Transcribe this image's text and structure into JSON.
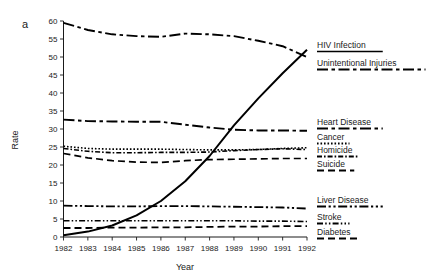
{
  "panel": {
    "label": "a"
  },
  "chart_data": {
    "type": "line",
    "title": "",
    "xlabel": "Year",
    "ylabel": "Rate",
    "xlim": [
      1982,
      1992
    ],
    "ylim": [
      0,
      60
    ],
    "ytick_step": 5,
    "grid": false,
    "legend_position": "right",
    "x": [
      1982,
      1983,
      1984,
      1985,
      1986,
      1987,
      1988,
      1989,
      1990,
      1991,
      1992
    ],
    "xticklabels": [
      "1982",
      "1983",
      "1984",
      "1985",
      "1986",
      "1987",
      "1988",
      "1989",
      "1990",
      "1991",
      "1992"
    ],
    "yticklabels": [
      "0",
      "5",
      "10",
      "15",
      "20",
      "25",
      "30",
      "35",
      "40",
      "45",
      "50",
      "55",
      "60"
    ],
    "series": [
      {
        "name": "HIV Infection",
        "dash": "solid",
        "width": 2.0,
        "values": [
          0.5,
          1.5,
          3.2,
          6.0,
          10.0,
          15.5,
          22.5,
          31.0,
          38.5,
          45.5,
          52.0
        ]
      },
      {
        "name": "Unintentional Injuries",
        "dash": "dashdot",
        "width": 1.9,
        "values": [
          59.5,
          57.5,
          56.3,
          55.8,
          55.6,
          56.5,
          56.3,
          55.8,
          54.5,
          53.0,
          50.0
        ]
      },
      {
        "name": "Heart Disease",
        "dash": "dashdot",
        "width": 1.9,
        "values": [
          32.6,
          32.2,
          32.1,
          32.0,
          32.0,
          31.2,
          30.4,
          29.8,
          29.6,
          29.6,
          29.5
        ]
      },
      {
        "name": "Cancer",
        "dash": "dotted",
        "width": 1.6,
        "values": [
          25.2,
          24.6,
          24.4,
          24.4,
          24.4,
          24.3,
          24.2,
          24.2,
          24.3,
          24.6,
          24.8
        ]
      },
      {
        "name": "Homicide",
        "dash": "dashdot-fine",
        "width": 1.6,
        "values": [
          24.6,
          23.8,
          23.4,
          23.4,
          23.5,
          23.5,
          23.6,
          24.0,
          24.3,
          24.5,
          24.3
        ]
      },
      {
        "name": "Suicide",
        "dash": "dashed",
        "width": 1.7,
        "values": [
          23.2,
          22.0,
          21.2,
          20.8,
          20.7,
          21.2,
          21.5,
          21.6,
          21.7,
          21.8,
          21.8
        ]
      },
      {
        "name": "Liver Disease",
        "dash": "dashdotdot",
        "width": 1.8,
        "values": [
          8.7,
          8.6,
          8.5,
          8.5,
          8.6,
          8.6,
          8.5,
          8.4,
          8.3,
          8.2,
          7.9
        ]
      },
      {
        "name": "Stroke",
        "dash": "dotted-dash",
        "width": 1.6,
        "values": [
          4.5,
          4.5,
          4.5,
          4.5,
          4.5,
          4.5,
          4.5,
          4.5,
          4.4,
          4.4,
          4.3
        ]
      },
      {
        "name": "Diabetes",
        "dash": "dashed",
        "width": 1.8,
        "values": [
          2.5,
          2.5,
          2.6,
          2.6,
          2.7,
          2.7,
          2.8,
          2.9,
          2.9,
          3.0,
          3.0
        ]
      }
    ]
  },
  "legend": {
    "entries": [
      {
        "label": "HIV Infection",
        "dash": "solid"
      },
      {
        "label": "Unintentional Injuries",
        "dash": "dashdot"
      },
      {
        "label": "Heart Disease",
        "dash": "dashdot"
      },
      {
        "label": "Cancer",
        "dash": "dotted"
      },
      {
        "label": "Homicide",
        "dash": "dashdot-fine"
      },
      {
        "label": "Suicide",
        "dash": "dashed"
      },
      {
        "label": "Liver Disease",
        "dash": "dashdotdot"
      },
      {
        "label": "Stroke",
        "dash": "dotted-dash"
      },
      {
        "label": "Diabetes",
        "dash": "dashed"
      }
    ]
  },
  "colors": {
    "ink": "#000000",
    "background": "#ffffff"
  }
}
